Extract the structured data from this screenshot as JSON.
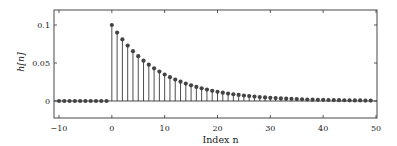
{
  "chart_data": {
    "type": "stem",
    "title": "",
    "xlabel": "Index n",
    "ylabel": "h[n]",
    "xlim": [
      -10,
      50
    ],
    "ylim": [
      -0.02,
      0.12
    ],
    "x_ticks": [
      -10,
      0,
      10,
      20,
      30,
      40,
      50
    ],
    "x_tick_labels": [
      "−10",
      "0",
      "10",
      "20",
      "30",
      "40",
      "50"
    ],
    "y_ticks": [
      0,
      0.05,
      0.1
    ],
    "y_tick_labels": [
      "0",
      "0.05",
      "0.1"
    ],
    "grid": false,
    "legend": null,
    "formula": "h[n] = 0.1 * 0.9^n for n >= 0, else 0",
    "x": [
      -10,
      -9,
      -8,
      -7,
      -6,
      -5,
      -4,
      -3,
      -2,
      -1,
      0,
      1,
      2,
      3,
      4,
      5,
      6,
      7,
      8,
      9,
      10,
      11,
      12,
      13,
      14,
      15,
      16,
      17,
      18,
      19,
      20,
      21,
      22,
      23,
      24,
      25,
      26,
      27,
      28,
      29,
      30,
      31,
      32,
      33,
      34,
      35,
      36,
      37,
      38,
      39,
      40,
      41,
      42,
      43,
      44,
      45,
      46,
      47,
      48,
      49
    ],
    "values": [
      0,
      0,
      0,
      0,
      0,
      0,
      0,
      0,
      0,
      0,
      0.1,
      0.09,
      0.081,
      0.0729,
      0.0656,
      0.059,
      0.0531,
      0.0478,
      0.043,
      0.0387,
      0.0349,
      0.0314,
      0.0282,
      0.0254,
      0.0229,
      0.0206,
      0.0185,
      0.0167,
      0.015,
      0.0135,
      0.0122,
      0.0109,
      0.0098,
      0.0089,
      0.008,
      0.0072,
      0.0065,
      0.0058,
      0.0052,
      0.0047,
      0.0042,
      0.0038,
      0.0034,
      0.0031,
      0.0028,
      0.0025,
      0.0023,
      0.002,
      0.0018,
      0.0016,
      0.0015,
      0.0013,
      0.0012,
      0.0011,
      0.001,
      0.0009,
      0.0008,
      0.0007,
      0.0006,
      0.0006
    ],
    "colors": {
      "stem": "#3a3a3a",
      "marker": "#444444",
      "axes": "#333333",
      "baseline": "#333333"
    }
  }
}
